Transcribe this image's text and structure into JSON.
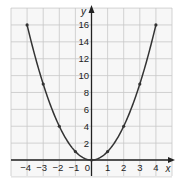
{
  "chart_data": {
    "type": "line",
    "title": "",
    "function": "y = x^2",
    "xlabel": "x",
    "ylabel": "y",
    "xlim": [
      -5,
      5
    ],
    "ylim": [
      -2,
      18
    ],
    "grid": true,
    "x_ticks": [
      -4,
      -3,
      -2,
      -1,
      0,
      1,
      2,
      3,
      4
    ],
    "x_tick_labels": [
      "−4",
      "−3",
      "−2",
      "−1",
      "0",
      "1",
      "2",
      "3",
      "4"
    ],
    "y_ticks": [
      2,
      4,
      6,
      8,
      10,
      12,
      14,
      16
    ],
    "y_tick_labels": [
      "2",
      "4",
      "6",
      "8",
      "10",
      "12",
      "14",
      "16"
    ],
    "series": [
      {
        "name": "y = x^2",
        "x": [
          -4,
          -3,
          -2,
          -1,
          0,
          1,
          2,
          3,
          4
        ],
        "y": [
          16,
          9,
          4,
          1,
          0,
          1,
          4,
          9,
          16
        ],
        "markers": true
      }
    ],
    "colors": {
      "curve": "#333333",
      "axis": "#222222",
      "grid": "#c8c8c8",
      "background": "#f7f7f7"
    }
  }
}
